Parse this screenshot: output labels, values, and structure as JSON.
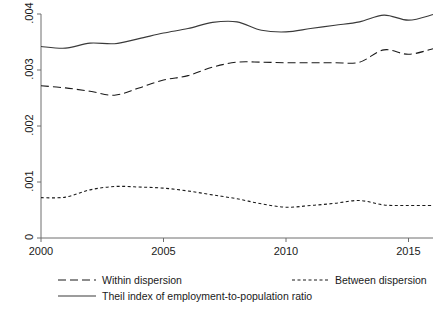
{
  "chart_data": {
    "type": "line",
    "title": "",
    "subtitle": "",
    "xlabel": "",
    "ylabel": "",
    "xlim": [
      2000,
      2016
    ],
    "ylim": [
      0,
      0.004
    ],
    "grid": false,
    "legend_position": "bottom",
    "x": [
      2000,
      2001,
      2002,
      2003,
      2004,
      2005,
      2006,
      2007,
      2008,
      2009,
      2010,
      2011,
      2012,
      2013,
      2014,
      2015,
      2016
    ],
    "xticks": [
      "2000",
      "2005",
      "2010",
      "2015"
    ],
    "xtick_values": [
      2000,
      2005,
      2010,
      2015
    ],
    "yticks": [
      "0",
      ".001",
      ".002",
      ".003",
      ".004"
    ],
    "ytick_values": [
      0,
      0.001,
      0.002,
      0.003,
      0.004
    ],
    "series": [
      {
        "name": "Within dispersion",
        "style": "long-dash",
        "color": "#1a1a1a",
        "values": [
          0.00272,
          0.00268,
          0.00262,
          0.00255,
          0.00268,
          0.00282,
          0.0029,
          0.00305,
          0.00314,
          0.00314,
          0.00313,
          0.00313,
          0.00313,
          0.00314,
          0.00336,
          0.00328,
          0.00338
        ]
      },
      {
        "name": "Between dispersion",
        "style": "short-dash",
        "color": "#1a1a1a",
        "values": [
          0.00072,
          0.00073,
          0.00086,
          0.00092,
          0.00091,
          0.00089,
          0.00084,
          0.00077,
          0.0007,
          0.00061,
          0.00055,
          0.00058,
          0.00062,
          0.00067,
          0.00059,
          0.00058,
          0.00058
        ]
      },
      {
        "name": "Theil index of employment-to-population ratio",
        "style": "solid",
        "color": "#3a3a3a",
        "values": [
          0.00342,
          0.00339,
          0.00348,
          0.00347,
          0.00356,
          0.00366,
          0.00374,
          0.00385,
          0.00386,
          0.00371,
          0.00368,
          0.00374,
          0.0038,
          0.00386,
          0.00398,
          0.00389,
          0.00399
        ]
      }
    ]
  },
  "legend": {
    "items": [
      {
        "label": "Within dispersion",
        "style": "long-dash"
      },
      {
        "label": "Between dispersion",
        "style": "short-dash"
      },
      {
        "label": "Theil index of employment-to-population ratio",
        "style": "solid"
      }
    ]
  }
}
